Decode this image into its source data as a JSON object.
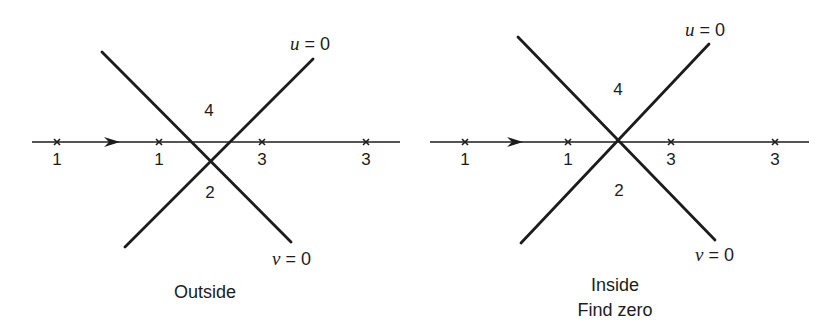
{
  "figure": {
    "panels": [
      {
        "id": "outside",
        "caption_lines": [
          "Outside"
        ],
        "axis": {
          "y": 142,
          "x_start": 32,
          "x_end": 400,
          "direction": "right"
        },
        "arrow_x": 115,
        "points": [
          {
            "x": 57,
            "label": "1"
          },
          {
            "x": 159,
            "label": "1"
          },
          {
            "x": 262,
            "label": "3"
          },
          {
            "x": 366,
            "label": "3"
          }
        ],
        "curves": [
          {
            "name": "u",
            "equation_var": "u",
            "equation_rest": " = 0",
            "from": [
              125,
              247
            ],
            "to": [
              313,
              59
            ],
            "label_pos": [
              290,
              50
            ]
          },
          {
            "name": "v",
            "equation_var": "v",
            "equation_rest": " = 0",
            "from": [
              102,
              52
            ],
            "to": [
              291,
              242
            ],
            "label_pos": [
              272,
              265
            ]
          }
        ],
        "regions": [
          {
            "label": "4",
            "pos": [
              209,
              116
            ]
          },
          {
            "label": "2",
            "pos": [
              210,
              198
            ]
          }
        ],
        "caption_pos": [
          205,
          298
        ]
      },
      {
        "id": "inside",
        "caption_lines": [
          "Inside",
          "Find zero"
        ],
        "axis": {
          "y": 142,
          "x_start": 430,
          "x_end": 809,
          "direction": "right"
        },
        "arrow_x": 518,
        "points": [
          {
            "x": 465,
            "label": "1"
          },
          {
            "x": 568,
            "label": "1"
          },
          {
            "x": 671,
            "label": "3"
          },
          {
            "x": 775,
            "label": "3"
          }
        ],
        "curves": [
          {
            "name": "u",
            "equation_var": "u",
            "equation_rest": " = 0",
            "from": [
              521,
              243
            ],
            "to": [
              709,
              44
            ],
            "label_pos": [
              685,
              36
            ]
          },
          {
            "name": "v",
            "equation_var": "v",
            "equation_rest": " = 0",
            "from": [
              518,
              37
            ],
            "to": [
              715,
              240
            ],
            "label_pos": [
              695,
              261
            ]
          }
        ],
        "regions": [
          {
            "label": "4",
            "pos": [
              618,
              95
            ]
          },
          {
            "label": "2",
            "pos": [
              619,
              196
            ]
          }
        ],
        "caption_pos": [
          615,
          291
        ]
      }
    ],
    "colors": {
      "ink": "#1c1c1c",
      "background": "#ffffff"
    }
  }
}
